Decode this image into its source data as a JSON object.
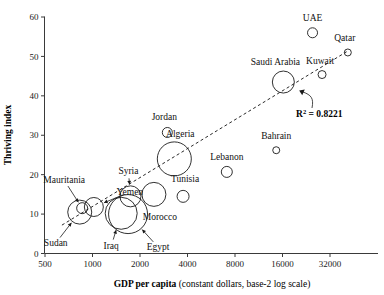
{
  "chart_data": {
    "type": "scatter",
    "title": "",
    "xlabel_bold": "GDP per capita",
    "xlabel_rest": " (constant dollars, base-2 log scale)",
    "ylabel": "Thriving index",
    "xscale": "log2",
    "xlim": [
      500,
      45255
    ],
    "ylim": [
      0,
      60
    ],
    "xticks": [
      500,
      1000,
      2000,
      4000,
      8000,
      16000,
      32000
    ],
    "xtick_labels": [
      "500",
      "1000",
      "2000",
      "4000",
      "8000",
      "16000",
      "32000"
    ],
    "yticks": [
      0,
      10,
      20,
      30,
      40,
      50,
      60
    ],
    "ytick_labels": [
      "0",
      "10",
      "20",
      "30",
      "40",
      "50",
      "60"
    ],
    "grid": false,
    "legend": "none",
    "annotations": [
      {
        "name": "r-squared",
        "text_prefix": "R",
        "text_sup": "2",
        "text_suffix": " = 0.8221",
        "value": 0.8221
      }
    ],
    "trendline": {
      "style": "dashed",
      "x_start": 640,
      "y_start": 7.2,
      "x_end": 42000,
      "y_end": 51.5
    },
    "size_encoding": "population",
    "points": [
      {
        "label": "Sudan",
        "x": 830,
        "y": 10.5,
        "r": 12.0,
        "label_dx": -24,
        "label_dy": 34,
        "leader": true
      },
      {
        "label": "Mauritania",
        "x": 860,
        "y": 11.5,
        "r": 5.5,
        "label_dx": -18,
        "label_dy": -25,
        "leader": true
      },
      {
        "label": "Yemen",
        "x": 1020,
        "y": 11.8,
        "r": 9.5,
        "label_dx": 36,
        "label_dy": -12,
        "leader": true
      },
      {
        "label": "Iraq",
        "x": 1520,
        "y": 10.2,
        "r": 16.0,
        "label_dx": -10,
        "label_dy": 36,
        "leader": true
      },
      {
        "label": "Egypt",
        "x": 1680,
        "y": 10.0,
        "r": 19.5,
        "label_dx": 30,
        "label_dy": 36,
        "leader": true
      },
      {
        "label": "Syria",
        "x": 1740,
        "y": 14.5,
        "r": 10.5,
        "label_dx": -2,
        "label_dy": -22,
        "leader": true
      },
      {
        "label": "Morocco",
        "x": 2450,
        "y": 15.0,
        "r": 12.0,
        "label_dx": 6,
        "label_dy": 26,
        "leader": false
      },
      {
        "label": "Tunisia",
        "x": 3750,
        "y": 14.5,
        "r": 6.0,
        "label_dx": 2,
        "label_dy": -14,
        "leader": false
      },
      {
        "label": "Algeria",
        "x": 3300,
        "y": 24.0,
        "r": 17.0,
        "label_dx": 6,
        "label_dy": -22,
        "leader": false
      },
      {
        "label": "Jordan",
        "x": 2980,
        "y": 30.7,
        "r": 5.0,
        "label_dx": -3,
        "label_dy": -12,
        "leader": false
      },
      {
        "label": "Lebanon",
        "x": 7100,
        "y": 20.7,
        "r": 5.5,
        "label_dx": 0,
        "label_dy": -12,
        "leader": false
      },
      {
        "label": "Bahrain",
        "x": 14600,
        "y": 26.2,
        "r": 3.5,
        "label_dx": 0,
        "label_dy": -11,
        "leader": false
      },
      {
        "label": "Saudi Arabia",
        "x": 16200,
        "y": 43.5,
        "r": 11.0,
        "label_dx": -8,
        "label_dy": -17,
        "leader": false
      },
      {
        "label": "Kuwait",
        "x": 28500,
        "y": 45.4,
        "r": 4.0,
        "label_dx": -2,
        "label_dy": -11,
        "leader": false
      },
      {
        "label": "UAE",
        "x": 24800,
        "y": 56.0,
        "r": 5.0,
        "label_dx": 0,
        "label_dy": -12,
        "leader": false
      },
      {
        "label": "Qatar",
        "x": 41500,
        "y": 51.0,
        "r": 3.5,
        "label_dx": -3,
        "label_dy": -11,
        "leader": false
      }
    ]
  }
}
